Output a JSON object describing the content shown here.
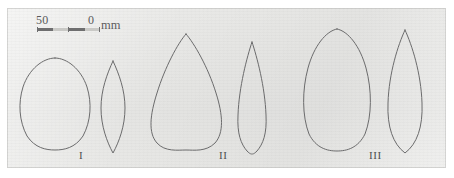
{
  "figure": {
    "kind": "leaf-outline-plate",
    "background_color": "#e7e7e5",
    "outline_color": "#6b6b6c",
    "text_color": "#59595a"
  },
  "scale_bar": {
    "left_label": "50",
    "right_label": "0",
    "unit": "mm",
    "segments": [
      "dark",
      "light",
      "dark",
      "light"
    ]
  },
  "groups": [
    {
      "label": "I"
    },
    {
      "label": "II"
    },
    {
      "label": "III"
    }
  ],
  "leaves": [
    {
      "name": "leaf-I-broad",
      "group": "I",
      "shape": "broadly-obovate",
      "left": 19,
      "top": 57,
      "width": 72,
      "height": 94,
      "path": "M36 1 C48 1 62 12 68 30 C73 46 72 64 64 79 C56 91 45 93 36 93 C27 93 16 91 8 79 C0 64 -1 46 4 30 C10 12 24 1 36 1 Z"
    },
    {
      "name": "leaf-I-narrow",
      "group": "I",
      "shape": "narrowly-elliptic",
      "left": 98,
      "top": 60,
      "width": 32,
      "height": 94,
      "path": "M15 1 C21 14 27 30 27 48 C27 66 21 82 15 93 C9 82 3 66 3 48 C3 30 9 14 15 1 Z"
    },
    {
      "name": "leaf-II-broad",
      "group": "II",
      "shape": "obovate-teardrop",
      "left": 150,
      "top": 33,
      "width": 76,
      "height": 118,
      "path": "M36 1 C44 10 58 34 66 60 C73 82 74 100 65 110 C56 119 44 117 36 117 C28 117 15 119 7 110 C-2 100 0 82 7 60 C15 34 28 10 36 1 Z"
    },
    {
      "name": "leaf-II-narrow",
      "group": "II",
      "shape": "narrow-teardrop",
      "left": 233,
      "top": 41,
      "width": 38,
      "height": 114,
      "path": "M19 1 C24 16 32 46 33 74 C34 93 30 103 24 110 C21 113 20 113 19 113 C18 113 17 113 14 110 C8 103 4 93 5 74 C6 46 14 16 19 1 Z"
    },
    {
      "name": "leaf-III-broad",
      "group": "III",
      "shape": "broadly-ovate",
      "left": 302,
      "top": 28,
      "width": 72,
      "height": 124,
      "path": "M35 1 C46 3 58 18 64 40 C70 62 70 88 63 106 C56 120 45 123 35 123 C25 123 14 120 7 106 C0 88 0 62 6 40 C12 18 24 3 35 1 Z"
    },
    {
      "name": "leaf-III-narrow",
      "group": "III",
      "shape": "narrowly-lanceolate",
      "left": 385,
      "top": 29,
      "width": 42,
      "height": 125,
      "path": "M20 1 C27 16 36 44 37 74 C38 98 32 115 20 124 C8 115 2 98 3 74 C4 44 13 16 20 1 Z"
    }
  ],
  "group_labels": [
    {
      "text": "I",
      "left": 79,
      "top": 150
    },
    {
      "text": "II",
      "left": 219,
      "top": 150
    },
    {
      "text": "III",
      "left": 369,
      "top": 150
    }
  ]
}
